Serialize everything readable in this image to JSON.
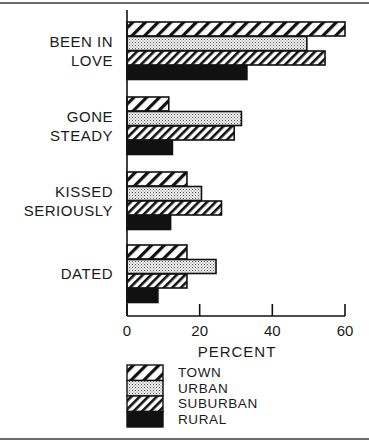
{
  "chart_data": {
    "type": "bar",
    "orientation": "horizontal",
    "title": "",
    "xlabel": "PERCENT",
    "ylabel": "",
    "xlim": [
      0,
      60
    ],
    "xticks": [
      0,
      20,
      40,
      60
    ],
    "grid": false,
    "legend_position": "bottom",
    "categories": [
      "BEEN IN\nLOVE",
      "GONE\nSTEADY",
      "KISSED\nSERIOUSLY",
      "DATED"
    ],
    "category_lines": [
      [
        "BEEN IN",
        "LOVE"
      ],
      [
        "GONE",
        "STEADY"
      ],
      [
        "KISSED",
        "SERIOUSLY"
      ],
      [
        "DATED"
      ]
    ],
    "series": [
      {
        "name": "TOWN",
        "pattern": "wide-hatch",
        "values": [
          60,
          11.5,
          16.5,
          16.5
        ]
      },
      {
        "name": "URBAN",
        "pattern": "dots",
        "values": [
          49.5,
          31.5,
          20.5,
          24.5
        ]
      },
      {
        "name": "SUBURBAN",
        "pattern": "dense-hatch",
        "values": [
          54.5,
          29.5,
          26,
          16.5
        ]
      },
      {
        "name": "RURAL",
        "pattern": "solid",
        "values": [
          33,
          12.5,
          12,
          8.5
        ]
      }
    ]
  }
}
